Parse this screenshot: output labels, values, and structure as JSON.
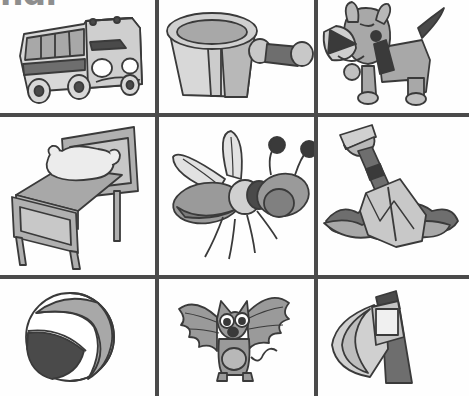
{
  "page": {
    "width": 469,
    "height": 396,
    "background": "#fefefe",
    "clipped_heading": "nd.",
    "line_color": "#4a4a4a"
  },
  "palette": {
    "outline": "#3a3a3a",
    "light": "#d8d8d8",
    "mid": "#a8a8a8",
    "dark": "#6e6e6e",
    "darkest": "#4a4a4a",
    "white": "#ffffff"
  },
  "grid": {
    "rows": 3,
    "columns": 3,
    "vertical_lines_x": [
      155,
      314
    ],
    "horizontal_lines_y": [
      113,
      275
    ],
    "cells": [
      {
        "row": 1,
        "column": 1,
        "name": "van",
        "label": "van",
        "x": 0,
        "y": 0,
        "width": 155,
        "height": 113
      },
      {
        "row": 1,
        "column": 2,
        "name": "pan",
        "label": "pan",
        "x": 159,
        "y": 0,
        "width": 155,
        "height": 113
      },
      {
        "row": 1,
        "column": 3,
        "name": "dog",
        "label": "dog",
        "x": 318,
        "y": 0,
        "width": 151,
        "height": 113
      },
      {
        "row": 2,
        "column": 1,
        "name": "bed",
        "label": "bed",
        "x": 0,
        "y": 117,
        "width": 155,
        "height": 158
      },
      {
        "row": 2,
        "column": 2,
        "name": "fly",
        "label": "fly",
        "x": 159,
        "y": 117,
        "width": 155,
        "height": 158
      },
      {
        "row": 2,
        "column": 3,
        "name": "shovel",
        "label": "shovel",
        "x": 318,
        "y": 117,
        "width": 151,
        "height": 158
      },
      {
        "row": 3,
        "column": 1,
        "name": "ball",
        "label": "ball",
        "x": 0,
        "y": 279,
        "width": 155,
        "height": 117
      },
      {
        "row": 3,
        "column": 2,
        "name": "bat",
        "label": "bat",
        "x": 159,
        "y": 279,
        "width": 155,
        "height": 117
      },
      {
        "row": 3,
        "column": 3,
        "name": "axe",
        "label": "axe",
        "x": 318,
        "y": 279,
        "width": 151,
        "height": 117
      }
    ]
  }
}
